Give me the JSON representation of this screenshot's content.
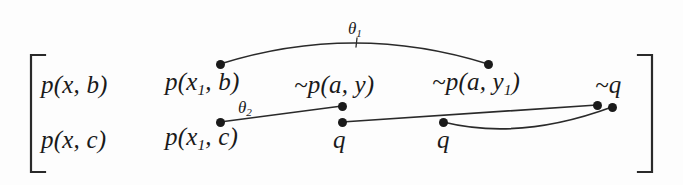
{
  "figure": {
    "background_color": "#fdfdfd",
    "ink_color": "#1a1a1a",
    "width": 683,
    "height": 185
  },
  "brackets": {
    "left": {
      "name": "left-square-bracket",
      "x": 31,
      "top": 55,
      "bottom": 172,
      "serif": 14
    },
    "right": {
      "name": "right-square-bracket",
      "x": 652,
      "top": 55,
      "bottom": 172,
      "serif": 14
    }
  },
  "matrix": {
    "rows": [
      {
        "name": "top-row",
        "cells": [
          {
            "text": "p(x, b)",
            "base": "p(x, b)",
            "sub": "",
            "tail": "",
            "x": 41,
            "y": 97
          },
          {
            "text": "p(x₁, b)",
            "base": "p(x",
            "sub": "1",
            "tail": ", b)",
            "x": 165,
            "y": 97
          },
          {
            "text": "~p(a, y)",
            "base": "~p(a, y)",
            "sub": "",
            "tail": "",
            "x": 294,
            "y": 97
          },
          {
            "text": "~p(a, y₁)",
            "base": "~p(a, y",
            "sub": "1",
            "tail": ")",
            "x": 432,
            "y": 97
          },
          {
            "text": "~q",
            "base": "~q",
            "sub": "",
            "tail": "",
            "x": 595,
            "y": 97
          }
        ]
      },
      {
        "name": "bottom-row",
        "cells": [
          {
            "text": "p(x, c)",
            "base": "p(x, c)",
            "sub": "",
            "tail": "",
            "x": 41,
            "y": 152
          },
          {
            "text": "p(x₁, c)",
            "base": "p(x",
            "sub": "1",
            "tail": ", c)",
            "x": 165,
            "y": 152
          },
          {
            "text": "q",
            "base": "q",
            "sub": "",
            "tail": "",
            "x": 333,
            "y": 152
          },
          {
            "text": "q",
            "base": "q",
            "sub": "",
            "tail": "",
            "x": 437,
            "y": 152
          }
        ]
      }
    ]
  },
  "substitutions": [
    {
      "name": "theta-1",
      "base": "θ",
      "sub": "1",
      "x": 348,
      "y": 20
    },
    {
      "name": "theta-2",
      "base": "θ",
      "sub": "2",
      "x": 238,
      "y": 99
    }
  ],
  "nodes": [
    {
      "name": "node-px1b",
      "x": 220,
      "y": 64
    },
    {
      "name": "node-pay1",
      "x": 488,
      "y": 64
    },
    {
      "name": "node-px1c",
      "x": 220,
      "y": 122
    },
    {
      "name": "node-pay",
      "x": 342,
      "y": 106
    },
    {
      "name": "node-q-first",
      "x": 342,
      "y": 122
    },
    {
      "name": "node-q-second",
      "x": 443,
      "y": 122
    },
    {
      "name": "node-nq-left",
      "x": 597,
      "y": 105
    },
    {
      "name": "node-nq-right",
      "x": 612,
      "y": 107
    }
  ],
  "links": [
    {
      "name": "link-theta-1-arc",
      "kind": "arc",
      "from": "node-px1b",
      "to": "node-pay1",
      "path": "M 220 64 Q 354 22 488 64"
    },
    {
      "name": "theta-1-tick",
      "kind": "tick",
      "path": "M 357 38 L 356 47"
    },
    {
      "name": "link-theta-2-line",
      "kind": "line",
      "from": "node-px1c",
      "to": "node-pay",
      "path": "M 220 122 L 342 106"
    },
    {
      "name": "link-q-to-nq-line",
      "kind": "line",
      "from": "node-q-first",
      "to": "node-nq-left",
      "path": "M 342 122 L 597 105"
    },
    {
      "name": "link-q-to-nq-curve",
      "kind": "curve",
      "from": "node-q-second",
      "to": "node-nq-right",
      "path": "M 443 122 Q 520 141 612 107"
    }
  ]
}
